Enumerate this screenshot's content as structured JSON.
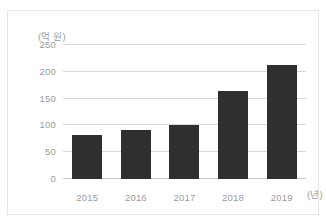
{
  "page": {
    "clipped_top_caption": ""
  },
  "chart_data": {
    "type": "bar",
    "title": "",
    "categories": [
      "2015",
      "2016",
      "2017",
      "2018",
      "2019"
    ],
    "values": [
      83,
      92,
      101,
      165,
      213
    ],
    "xlabel": "(년)",
    "ylabel": "(억 원)",
    "ylim": [
      0,
      250
    ],
    "yticks": [
      0,
      50,
      100,
      150,
      200,
      250
    ],
    "ytick_labels": [
      "0",
      "50",
      "100",
      "150",
      "200",
      "250"
    ],
    "grid": true,
    "legend": false,
    "bar_color": "#2f2f2f",
    "gridline_color": "#d8d8da",
    "tick_label_color": "#9a9a9e",
    "border_color": "#e6e6e8",
    "background": "#ffffff"
  }
}
